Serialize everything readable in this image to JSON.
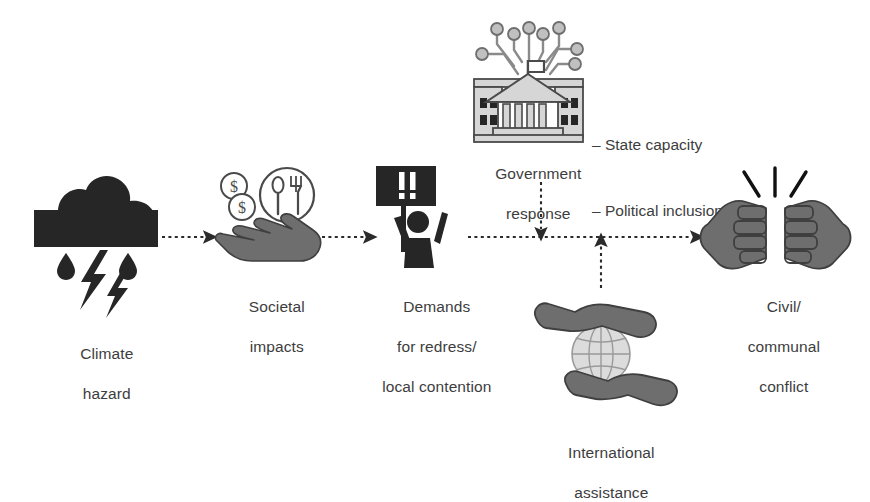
{
  "figure": {
    "type": "flow-diagram",
    "background_color": "#ffffff",
    "dark_fill": "#262626",
    "gray_fill": "#6e6e6e",
    "light_fill": "#d6d6d6",
    "outline_color": "#4a4a4a",
    "arrow_color": "#2b2b2b",
    "text_color": "#3d3d3d"
  },
  "nodes": {
    "climate_hazard": {
      "icon": "storm-cloud-rain-lightning-icon",
      "label_line1": "Climate",
      "label_line2": "hazard"
    },
    "societal_impacts": {
      "icon": "hand-with-money-and-food-icon",
      "label_line1": "Societal",
      "label_line2": "impacts",
      "sub_icons": [
        "dollar-coin-icon",
        "dollar-coin-icon",
        "plate-spoon-fork-icon",
        "open-hand-icon"
      ]
    },
    "demands_redress": {
      "icon": "protester-with-sign-icon",
      "sign_text": "!!",
      "label_line1": "Demands",
      "label_line2": "for redress/",
      "label_line3": "local contention"
    },
    "government_response": {
      "icon": "government-building-network-icon",
      "label_line1": "Government",
      "label_line2": "response",
      "bullets": [
        "– State capacity",
        "– Political inclusion"
      ]
    },
    "international_assistance": {
      "icon": "hands-cradling-globe-icon",
      "label_line1": "International",
      "label_line2": "assistance"
    },
    "civil_conflict": {
      "icon": "clashing-fists-icon",
      "label_line1": "Civil/",
      "label_line2": "communal",
      "label_line3": "conflict"
    }
  },
  "arrows": [
    {
      "name": "climate-to-societal",
      "style": "dashed",
      "direction": "right"
    },
    {
      "name": "societal-to-demands",
      "style": "dashed",
      "direction": "right"
    },
    {
      "name": "demands-to-conflict",
      "style": "dashed",
      "direction": "right"
    },
    {
      "name": "government-to-flow",
      "style": "dashed",
      "direction": "down"
    },
    {
      "name": "assistance-to-flow",
      "style": "dashed",
      "direction": "up"
    }
  ]
}
